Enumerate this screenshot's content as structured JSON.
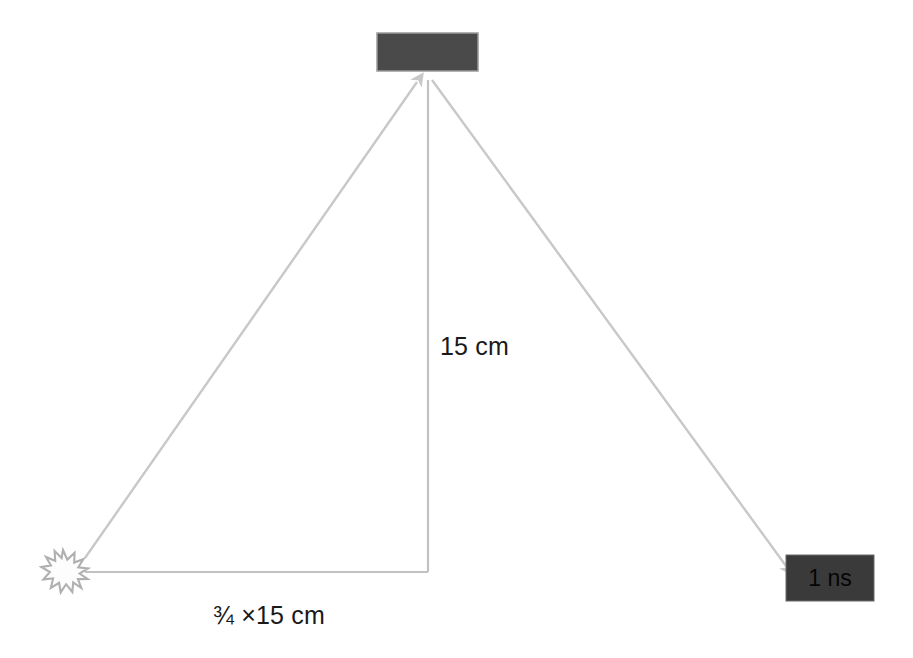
{
  "diagram": {
    "background_color": "#ffffff",
    "line_color": "#c0c0c0",
    "arrow_color": "#c8c8c8",
    "text_color": "#1a1a1a"
  },
  "nodes": {
    "reflector": {
      "name": "reflector-block",
      "label": "",
      "fill_color": "#4a4a4a",
      "x": 377,
      "y": 33,
      "width": 101,
      "height": 38
    },
    "source": {
      "name": "light-source-burst",
      "label": "",
      "fill_color": "#ffffff",
      "stroke_color": "#b4b4b4",
      "cx": 63,
      "cy": 572,
      "radius": 21
    },
    "detector": {
      "name": "detector-block",
      "label": "1 ns",
      "fill_color": "#3a3a3a",
      "text_color": "#050505",
      "x": 786,
      "y": 555,
      "width": 88,
      "height": 46
    }
  },
  "edges": {
    "incident_ray": {
      "name": "incident-ray",
      "from": "source",
      "to": "reflector",
      "x1": 85,
      "y1": 558,
      "x2": 420,
      "y2": 78,
      "arrowhead": "end"
    },
    "reflected_ray": {
      "name": "reflected-ray",
      "from": "reflector",
      "to": "detector",
      "x1": 432,
      "y1": 80,
      "x2": 790,
      "y2": 570,
      "arrowhead": "end"
    },
    "vertical_leg": {
      "name": "vertical-distance-line",
      "x1": 428,
      "y1": 80,
      "x2": 428,
      "y2": 572,
      "arrowhead": "none"
    },
    "horizontal_leg": {
      "name": "horizontal-distance-line",
      "x1": 85,
      "y1": 572,
      "x2": 428,
      "y2": 572,
      "arrowhead": "none"
    }
  },
  "labels": {
    "vertical_distance": "15 cm",
    "horizontal_distance": "¾ ×15 cm",
    "detector_time": "1 ns"
  }
}
